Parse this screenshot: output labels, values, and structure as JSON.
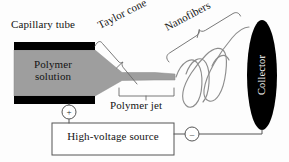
{
  "figure": {
    "kind": "schematic-diagram",
    "width": 289,
    "height": 162,
    "background_color": "#fdfdfd",
    "line_color": "#555555",
    "text_color": "#141414"
  },
  "labels": {
    "capillary_tube": "Capillary tube",
    "taylor_cone": "Taylor cone",
    "nanofibers": "Nanofibers",
    "polymer_solution": "Polymer\nsolution",
    "polymer_solution_line1": "Polymer",
    "polymer_solution_line2": "solution",
    "polymer_jet": "Polymer jet",
    "collector": "Collector",
    "high_voltage_source": "High-voltage source",
    "positive_terminal": "+",
    "negative_terminal": "–"
  },
  "parts": {
    "capillary_tube": {
      "name": "capillary-tube",
      "fill": "#000000",
      "top_bar": {
        "x": 14,
        "y": 42,
        "width": 81,
        "height": 8
      },
      "bottom_bar": {
        "x": 14,
        "y": 96,
        "width": 81,
        "height": 8
      }
    },
    "polymer_solution_body": {
      "name": "polymer-solution",
      "fill": "#9e9e9e",
      "stroke": "#7a7a7a"
    },
    "taylor_cone_region": {
      "name": "taylor-cone"
    },
    "polymer_jet": {
      "name": "polymer-jet",
      "fill": "#9e9e9e"
    },
    "nanofiber_coils": {
      "name": "nanofiber-coils",
      "stroke": "#8d8d8d",
      "count": 3
    },
    "collector": {
      "name": "collector-plate",
      "shape": "ellipse",
      "fill": "#000000",
      "cx": 262,
      "cy": 75,
      "rx": 15,
      "ry": 55
    },
    "high_voltage_source": {
      "name": "high-voltage-source",
      "shape": "rectangle",
      "x": 52,
      "y": 123,
      "width": 122,
      "height": 32,
      "stroke": "#555555",
      "fill": "#ffffff"
    },
    "positive_terminal": {
      "name": "positive-terminal",
      "cx": 69,
      "cy": 112,
      "r": 7
    },
    "negative_terminal": {
      "name": "negative-terminal",
      "cx": 192,
      "cy": 134,
      "r": 7
    },
    "brackets": [
      {
        "name": "taylor-cone-bracket"
      },
      {
        "name": "nanofibers-bracket"
      },
      {
        "name": "polymer-jet-bracket"
      }
    ]
  }
}
